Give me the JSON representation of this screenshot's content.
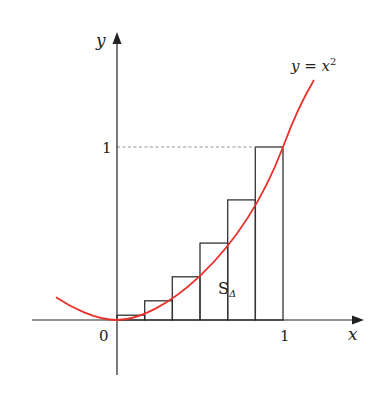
{
  "figure": {
    "curve_label": "y = x",
    "curve_label_exponent": "2",
    "y_axis_label": "y",
    "x_axis_label": "x",
    "origin_label": "0",
    "x_tick_label": "1",
    "y_tick_label": "1",
    "area_label": "S",
    "area_label_subscript": "Δ",
    "colors": {
      "curve": "#e8302a",
      "axes": "#222222",
      "rects": "#333333",
      "dashed_guide": "#888888"
    },
    "rectangles": {
      "count": 6,
      "partition": [
        "0",
        "1/6",
        "2/6",
        "3/6",
        "4/6",
        "5/6",
        "1"
      ],
      "heights": [
        "1/36",
        "4/36",
        "9/36",
        "16/36",
        "25/36",
        "1"
      ]
    }
  }
}
